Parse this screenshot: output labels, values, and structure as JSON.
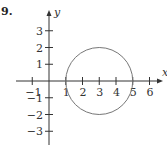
{
  "problem_number": "9.",
  "chart_data": {
    "type": "line",
    "title": "",
    "xlabel": "x",
    "ylabel": "y",
    "xlim": [
      -1.5,
      6.5
    ],
    "ylim": [
      -3.5,
      3.5
    ],
    "grid": false,
    "x_ticks": [
      -1,
      1,
      2,
      3,
      4,
      5,
      6
    ],
    "y_ticks": [
      -3,
      -2,
      -1,
      1,
      2,
      3
    ],
    "x_tick_labels": [
      "−1",
      "1",
      "2",
      "3",
      "4",
      "5",
      "6"
    ],
    "y_tick_labels": [
      "−3",
      "−2",
      "−1",
      "1",
      "2",
      "3"
    ],
    "series": [
      {
        "name": "circle",
        "shape": "circle",
        "center": [
          3,
          0
        ],
        "radius": 2,
        "color": "#777777"
      }
    ]
  },
  "colors": {
    "axis": "#333333",
    "curve": "#777777"
  }
}
